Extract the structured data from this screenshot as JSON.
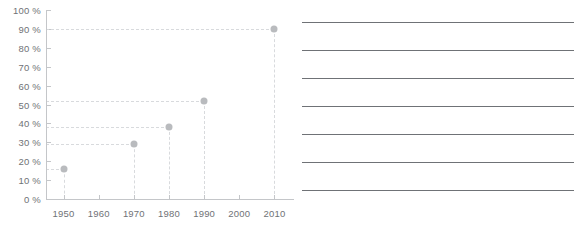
{
  "chart_data": {
    "type": "scatter",
    "title": "",
    "subtitle": "",
    "xlabel": "",
    "ylabel": "",
    "grid": true,
    "legend": null,
    "xlim": [
      1945,
      2015
    ],
    "ylim": [
      0,
      100
    ],
    "x_ticks": [
      "1950",
      "1960",
      "1970",
      "1980",
      "1990",
      "2000",
      "2010"
    ],
    "x_tick_values": [
      1950,
      1960,
      1970,
      1980,
      1990,
      2000,
      2010
    ],
    "y_ticks": [
      "0 %",
      "10 %",
      "20 %",
      "30 %",
      "40 %",
      "50 %",
      "60 %",
      "70 %",
      "80 %",
      "90 %",
      "100 %"
    ],
    "y_tick_values": [
      0,
      10,
      20,
      30,
      40,
      50,
      60,
      70,
      80,
      90,
      100
    ],
    "x": [
      1950,
      1970,
      1980,
      1990,
      2010
    ],
    "values": [
      16,
      29,
      38,
      52,
      90
    ],
    "points": [
      {
        "x": 1950,
        "y": 16
      },
      {
        "x": 1970,
        "y": 29
      },
      {
        "x": 1980,
        "y": 38
      },
      {
        "x": 1990,
        "y": 52
      },
      {
        "x": 2010,
        "y": 90
      }
    ],
    "marker_color": "#b9bbbe",
    "gridline_color": "#d8dadd",
    "axis_color": "#c4c6c9",
    "tick_label_color": "#6f7276"
  },
  "notes": {
    "line_color": "#6f7276",
    "lines": [
      "",
      "",
      "",
      "",
      "",
      "",
      ""
    ]
  }
}
